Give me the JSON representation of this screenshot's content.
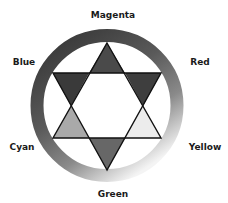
{
  "diagram": {
    "type": "color-wheel-hexagram",
    "ring": {
      "center": [
        107,
        105.5
      ],
      "radius": 70,
      "stroke_width": 13,
      "gradient_stops": [
        {
          "offset": "0%",
          "color": "#3c3c3c"
        },
        {
          "offset": "40%",
          "color": "#5a5a5a"
        },
        {
          "offset": "70%",
          "color": "#8a8a8a"
        },
        {
          "offset": "100%",
          "color": "#f4f4f4"
        }
      ]
    },
    "triangles": {
      "up": {
        "points": "107,43 161,138 53,138"
      },
      "down": {
        "points": "107,170 53,73 161,73"
      }
    },
    "segments": [
      {
        "name": "magenta-segment",
        "points": "107,43 125,73 89,73",
        "color": "#4a4a4a"
      },
      {
        "name": "red-segment",
        "points": "125,73 161,73 143,106",
        "color": "#3e3e3e"
      },
      {
        "name": "yellow-segment",
        "points": "143,106 161,138 125,138",
        "color": "#ececec"
      },
      {
        "name": "green-segment",
        "points": "125,138 89,138 107,170",
        "color": "#676767"
      },
      {
        "name": "cyan-segment",
        "points": "89,138 53,138 71,106",
        "color": "#a9a9a9"
      },
      {
        "name": "blue-segment",
        "points": "71,106 53,73 89,73",
        "color": "#3a3a3a"
      }
    ],
    "labels": [
      {
        "text": "Magenta",
        "x": 113,
        "y": 15
      },
      {
        "text": "Red",
        "x": 200,
        "y": 62
      },
      {
        "text": "Yellow",
        "x": 205,
        "y": 147
      },
      {
        "text": "Green",
        "x": 113,
        "y": 194
      },
      {
        "text": "Cyan",
        "x": 22,
        "y": 147
      },
      {
        "text": "Blue",
        "x": 24,
        "y": 62
      }
    ]
  }
}
